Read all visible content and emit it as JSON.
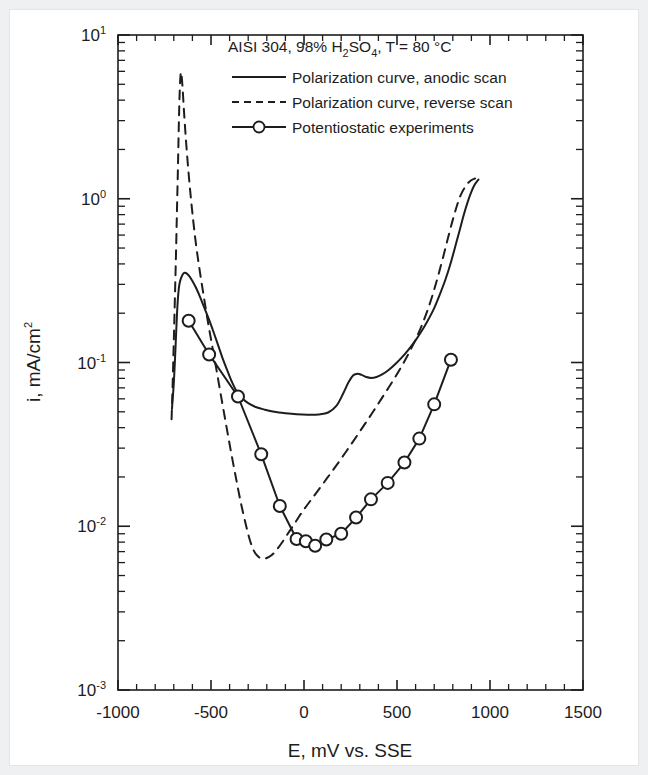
{
  "figure": {
    "background_color": "#ffffff",
    "line_color": "#1d1d1d",
    "border_color": "#eef0f1"
  },
  "legend": {
    "title_parts": {
      "before_h2so4": "AISI 304, 98% H",
      "sub_2": "2",
      "so": "SO",
      "sub_4": "4",
      "after": ", T = 80 °C"
    },
    "title_full": "AISI 304, 98% H2SO4, T = 80 °C",
    "entries": [
      {
        "label": "Polarization curve, anodic scan",
        "style": "solid",
        "marker": "none"
      },
      {
        "label": "Polarization curve, reverse scan",
        "style": "dashed",
        "marker": "none"
      },
      {
        "label": "Potentiostatic experiments",
        "style": "solid",
        "marker": "circle"
      }
    ]
  },
  "chart_data": {
    "type": "line",
    "title": "",
    "xlabel_parts": {
      "symbol": "E",
      "rest": ", mV vs. SSE"
    },
    "xlabel": "E, mV vs. SSE",
    "ylabel_parts": {
      "symbol": "i",
      "rest": ", mA/cm",
      "sup": "2"
    },
    "ylabel": "i, mA/cm2",
    "xscale": "linear",
    "yscale": "log",
    "xlim": [
      -1000,
      1500
    ],
    "ylim": [
      0.001,
      10
    ],
    "grid": false,
    "legend_position": "top-center",
    "xticks": [
      -1000,
      -500,
      0,
      500,
      1000,
      1500
    ],
    "xtick_labels": [
      "-1000",
      "-500",
      "0",
      "500",
      "1000",
      "1500"
    ],
    "xminor_count": 5,
    "yticks": [
      0.001,
      0.01,
      0.1,
      1,
      10
    ],
    "ytick_labels": [
      "10-3",
      "10-2",
      "10-1",
      "100",
      "101"
    ],
    "ytick_exponents": [
      "-3",
      "-2",
      "-1",
      "0",
      "1"
    ],
    "series": [
      {
        "name": "Polarization curve, anodic scan",
        "style": "solid",
        "marker": "none",
        "points": [
          [
            -710,
            0.052
          ],
          [
            -700,
            0.075
          ],
          [
            -692,
            0.115
          ],
          [
            -685,
            0.175
          ],
          [
            -678,
            0.245
          ],
          [
            -670,
            0.3
          ],
          [
            -660,
            0.33
          ],
          [
            -648,
            0.35
          ],
          [
            -635,
            0.352
          ],
          [
            -620,
            0.34
          ],
          [
            -600,
            0.315
          ],
          [
            -580,
            0.285
          ],
          [
            -558,
            0.25
          ],
          [
            -535,
            0.215
          ],
          [
            -510,
            0.182
          ],
          [
            -485,
            0.152
          ],
          [
            -460,
            0.126
          ],
          [
            -435,
            0.104
          ],
          [
            -410,
            0.088
          ],
          [
            -385,
            0.075
          ],
          [
            -360,
            0.066
          ],
          [
            -330,
            0.06
          ],
          [
            -300,
            0.0565
          ],
          [
            -260,
            0.0535
          ],
          [
            -210,
            0.0515
          ],
          [
            -160,
            0.05
          ],
          [
            -100,
            0.049
          ],
          [
            -40,
            0.0483
          ],
          [
            20,
            0.048
          ],
          [
            80,
            0.0482
          ],
          [
            130,
            0.0495
          ],
          [
            175,
            0.0545
          ],
          [
            210,
            0.0645
          ],
          [
            240,
            0.076
          ],
          [
            265,
            0.0835
          ],
          [
            288,
            0.0855
          ],
          [
            310,
            0.084
          ],
          [
            335,
            0.0815
          ],
          [
            360,
            0.0805
          ],
          [
            390,
            0.0815
          ],
          [
            420,
            0.0845
          ],
          [
            455,
            0.09
          ],
          [
            490,
            0.0975
          ],
          [
            525,
            0.107
          ],
          [
            560,
            0.119
          ],
          [
            595,
            0.134
          ],
          [
            630,
            0.154
          ],
          [
            665,
            0.18
          ],
          [
            700,
            0.215
          ],
          [
            730,
            0.26
          ],
          [
            760,
            0.32
          ],
          [
            790,
            0.41
          ],
          [
            815,
            0.52
          ],
          [
            838,
            0.65
          ],
          [
            858,
            0.79
          ],
          [
            878,
            0.94
          ],
          [
            898,
            1.09
          ],
          [
            918,
            1.22
          ],
          [
            938,
            1.31
          ]
        ]
      },
      {
        "name": "Polarization curve, reverse scan",
        "style": "dashed",
        "marker": "none",
        "points": [
          [
            -712,
            0.045
          ],
          [
            -706,
            0.075
          ],
          [
            -700,
            0.135
          ],
          [
            -694,
            0.25
          ],
          [
            -688,
            0.47
          ],
          [
            -683,
            0.85
          ],
          [
            -678,
            1.5
          ],
          [
            -674,
            2.5
          ],
          [
            -670,
            3.9
          ],
          [
            -666,
            5.2
          ],
          [
            -662,
            5.9
          ],
          [
            -658,
            5.65
          ],
          [
            -652,
            4.6
          ],
          [
            -645,
            3.4
          ],
          [
            -636,
            2.4
          ],
          [
            -625,
            1.65
          ],
          [
            -612,
            1.12
          ],
          [
            -597,
            0.76
          ],
          [
            -580,
            0.52
          ],
          [
            -560,
            0.36
          ],
          [
            -538,
            0.25
          ],
          [
            -515,
            0.173
          ],
          [
            -490,
            0.12
          ],
          [
            -465,
            0.083
          ],
          [
            -440,
            0.057
          ],
          [
            -415,
            0.0395
          ],
          [
            -390,
            0.0275
          ],
          [
            -365,
            0.0195
          ],
          [
            -340,
            0.014
          ],
          [
            -315,
            0.0105
          ],
          [
            -292,
            0.0083
          ],
          [
            -270,
            0.0071
          ],
          [
            -248,
            0.00655
          ],
          [
            -225,
            0.00635
          ],
          [
            -200,
            0.0064
          ],
          [
            -175,
            0.00665
          ],
          [
            -150,
            0.0071
          ],
          [
            -120,
            0.0079
          ],
          [
            -90,
            0.0089
          ],
          [
            -60,
            0.01
          ],
          [
            -28,
            0.0114
          ],
          [
            5,
            0.0129
          ],
          [
            40,
            0.0146
          ],
          [
            75,
            0.0165
          ],
          [
            110,
            0.0187
          ],
          [
            145,
            0.0212
          ],
          [
            182,
            0.0242
          ],
          [
            220,
            0.0279
          ],
          [
            258,
            0.0322
          ],
          [
            296,
            0.0373
          ],
          [
            334,
            0.0432
          ],
          [
            372,
            0.0502
          ],
          [
            410,
            0.0585
          ],
          [
            448,
            0.0683
          ],
          [
            486,
            0.08
          ],
          [
            524,
            0.0945
          ],
          [
            560,
            0.112
          ],
          [
            596,
            0.135
          ],
          [
            630,
            0.165
          ],
          [
            662,
            0.205
          ],
          [
            692,
            0.26
          ],
          [
            720,
            0.335
          ],
          [
            748,
            0.44
          ],
          [
            774,
            0.575
          ],
          [
            798,
            0.73
          ],
          [
            820,
            0.89
          ],
          [
            842,
            1.05
          ],
          [
            866,
            1.18
          ],
          [
            892,
            1.28
          ],
          [
            920,
            1.33
          ]
        ]
      },
      {
        "name": "Potentiostatic experiments",
        "style": "solid",
        "marker": "circle",
        "points": [
          [
            -620,
            0.18
          ],
          [
            -510,
            0.112
          ],
          [
            -355,
            0.062
          ],
          [
            -230,
            0.0275
          ],
          [
            -130,
            0.0133
          ],
          [
            -40,
            0.00835
          ],
          [
            10,
            0.0081
          ],
          [
            60,
            0.0076
          ],
          [
            120,
            0.0083
          ],
          [
            200,
            0.009
          ],
          [
            280,
            0.0113
          ],
          [
            360,
            0.0146
          ],
          [
            450,
            0.0184
          ],
          [
            540,
            0.0245
          ],
          [
            620,
            0.0343
          ],
          [
            700,
            0.0555
          ],
          [
            790,
            0.104
          ]
        ]
      }
    ]
  }
}
